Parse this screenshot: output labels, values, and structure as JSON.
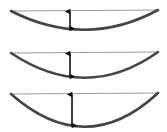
{
  "figure": {
    "background_color": "#ffffff",
    "width": 167,
    "height": 132
  },
  "style": {
    "arc_color": "#454545",
    "chord_color": "#9a9a9a",
    "arrow_color": "#111111",
    "arc_stroke_width": 2.6,
    "chord_stroke_width": 1.0,
    "arrow_stroke_width": 1.6
  },
  "chart_data": {
    "type": "diagram",
    "xlabel": "",
    "ylabel": "",
    "panels": [
      {
        "index": 1,
        "name": "shallow-arc",
        "label": "",
        "chord_y": 11,
        "left_x": 11,
        "right_x": 158,
        "apex_x": 86,
        "apex_y": 30,
        "sag": 19,
        "arrow": {
          "x": 70,
          "top_y": 11,
          "bottom_y": 28,
          "length": 17,
          "double_headed": true
        }
      },
      {
        "index": 2,
        "name": "medium-arc",
        "label": "",
        "chord_y": 53,
        "left_x": 11,
        "right_x": 158,
        "apex_x": 86,
        "apex_y": 78,
        "sag": 25,
        "arrow": {
          "x": 70,
          "top_y": 53,
          "bottom_y": 76,
          "length": 23,
          "double_headed": true
        }
      },
      {
        "index": 3,
        "name": "deep-arc",
        "label": "",
        "chord_y": 94,
        "left_x": 11,
        "right_x": 158,
        "apex_x": 86,
        "apex_y": 127,
        "sag": 33,
        "arrow": {
          "x": 72,
          "top_y": 94,
          "bottom_y": 125,
          "length": 31,
          "double_headed": true
        }
      }
    ]
  }
}
